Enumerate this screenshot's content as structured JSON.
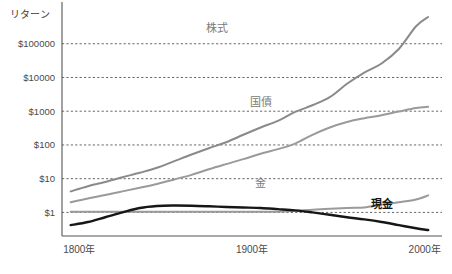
{
  "chart_data": {
    "type": "line",
    "title": "",
    "subtitle": "",
    "xlabel": "",
    "ylabel": "リターン",
    "yscale": "log",
    "ylim": [
      0.2,
      1000000
    ],
    "xlim": [
      1790,
      2010
    ],
    "grid": true,
    "legend_position": "inline-labels",
    "y_ticks": [
      {
        "value": 1,
        "label": "$1"
      },
      {
        "value": 10,
        "label": "$10"
      },
      {
        "value": 100,
        "label": "$100"
      },
      {
        "value": 1000,
        "label": "$1000"
      },
      {
        "value": 10000,
        "label": "$10000"
      },
      {
        "value": 100000,
        "label": "$100000"
      }
    ],
    "x_ticks": [
      {
        "value": 1800,
        "label": "1800年"
      },
      {
        "value": 1900,
        "label": "1900年"
      },
      {
        "value": 2000,
        "label": "2000年"
      }
    ],
    "series": [
      {
        "name": "株式",
        "label": "株式",
        "color": "#8a8a8a",
        "width": 2.0,
        "label_x": 1880,
        "label_y": 220000,
        "x": [
          1795,
          1805,
          1815,
          1825,
          1835,
          1845,
          1855,
          1865,
          1875,
          1885,
          1895,
          1905,
          1915,
          1925,
          1935,
          1945,
          1955,
          1965,
          1975,
          1985,
          1995,
          2002
        ],
        "y": [
          4.2,
          6.0,
          8.0,
          11.0,
          15.0,
          21.0,
          33.0,
          52.0,
          80.0,
          120.0,
          200.0,
          330.0,
          520.0,
          950.0,
          1500.0,
          2600.0,
          6500.0,
          14000.0,
          26000.0,
          70000.0,
          330000.0,
          620000.0
        ]
      },
      {
        "name": "国債",
        "label": "国債",
        "color": "#9a9a9a",
        "width": 2.0,
        "label_x": 1905,
        "label_y": 1450,
        "x": [
          1795,
          1805,
          1815,
          1825,
          1835,
          1845,
          1855,
          1865,
          1875,
          1885,
          1895,
          1905,
          1915,
          1925,
          1935,
          1945,
          1955,
          1965,
          1975,
          1985,
          1995,
          2002
        ],
        "y": [
          2.0,
          2.6,
          3.3,
          4.2,
          5.4,
          7.0,
          9.5,
          13.0,
          19.0,
          27.0,
          38.0,
          55.0,
          75.0,
          110.0,
          200.0,
          330.0,
          480.0,
          620.0,
          760.0,
          980.0,
          1250.0,
          1350.0
        ]
      },
      {
        "name": "金",
        "label": "金",
        "color": "#9a9a9a",
        "width": 2.0,
        "label_x": 1905,
        "label_y": 5.8,
        "x": [
          1795,
          1815,
          1835,
          1855,
          1875,
          1895,
          1915,
          1935,
          1955,
          1965,
          1975,
          1985,
          1995,
          2002
        ],
        "y": [
          1.05,
          1.05,
          1.05,
          1.05,
          1.05,
          1.05,
          1.05,
          1.2,
          1.35,
          1.4,
          1.7,
          2.0,
          2.4,
          3.2
        ]
      },
      {
        "name": "現金",
        "label": "現金",
        "color": "#161616",
        "width": 2.4,
        "label_x": 1975,
        "label_y": 1.35,
        "x": [
          1795,
          1805,
          1815,
          1825,
          1835,
          1845,
          1855,
          1865,
          1875,
          1885,
          1895,
          1905,
          1915,
          1925,
          1935,
          1945,
          1955,
          1965,
          1975,
          1985,
          1995,
          2002
        ],
        "y": [
          0.42,
          0.52,
          0.72,
          1.0,
          1.35,
          1.55,
          1.6,
          1.58,
          1.52,
          1.45,
          1.4,
          1.35,
          1.25,
          1.15,
          1.0,
          0.85,
          0.72,
          0.62,
          0.52,
          0.42,
          0.34,
          0.3
        ]
      }
    ]
  },
  "plot": {
    "left": 62,
    "right": 442,
    "top": 10,
    "bottom": 236
  }
}
